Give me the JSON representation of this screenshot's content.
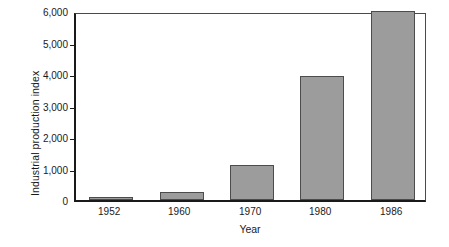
{
  "chart_data": {
    "type": "bar",
    "title": "",
    "subtitle": "",
    "xlabel": "Year",
    "ylabel": "Industrial production index",
    "categories": [
      "1952",
      "1960",
      "1970",
      "1980",
      "1986"
    ],
    "values": [
      100,
      250,
      1100,
      3950,
      6000
    ],
    "series": [
      {
        "name": "Industrial production index",
        "values": [
          100,
          250,
          1100,
          3950,
          6000
        ]
      }
    ],
    "ylim": [
      0,
      6000
    ],
    "ytick_values": [
      0,
      1000,
      2000,
      3000,
      4000,
      5000,
      6000
    ],
    "ytick_labels": [
      "0",
      "1,000",
      "2,000",
      "3,000",
      "4,000",
      "5,000",
      "6,000"
    ],
    "grid": false,
    "legend": false,
    "legend_position": "none",
    "bar_color": "#9c9c9c",
    "bar_edge_color": "#4c4c4c",
    "axis_color": "#1a1a1a",
    "background_color": "#ffffff",
    "annotations": []
  }
}
